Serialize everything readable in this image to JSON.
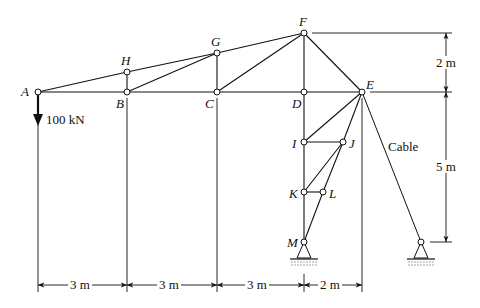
{
  "figure": {
    "type": "truss-with-cable",
    "nodes": [
      {
        "id": "A",
        "x": 38,
        "y": 92
      },
      {
        "id": "H",
        "x": 127,
        "y": 72
      },
      {
        "id": "B",
        "x": 127,
        "y": 92
      },
      {
        "id": "G",
        "x": 217,
        "y": 53
      },
      {
        "id": "C",
        "x": 217,
        "y": 92
      },
      {
        "id": "F",
        "x": 304,
        "y": 33
      },
      {
        "id": "D",
        "x": 304,
        "y": 92
      },
      {
        "id": "E",
        "x": 362,
        "y": 92
      },
      {
        "id": "I",
        "x": 304,
        "y": 142
      },
      {
        "id": "J",
        "x": 343,
        "y": 142
      },
      {
        "id": "K",
        "x": 304,
        "y": 192
      },
      {
        "id": "L",
        "x": 323,
        "y": 192
      },
      {
        "id": "M",
        "x": 304,
        "y": 242
      },
      {
        "id": "S",
        "x": 421,
        "y": 242
      }
    ],
    "members": [
      [
        "A",
        "H"
      ],
      [
        "H",
        "G"
      ],
      [
        "G",
        "F"
      ],
      [
        "A",
        "B"
      ],
      [
        "B",
        "C"
      ],
      [
        "C",
        "D"
      ],
      [
        "D",
        "E"
      ],
      [
        "H",
        "B"
      ],
      [
        "B",
        "G"
      ],
      [
        "G",
        "C"
      ],
      [
        "C",
        "F"
      ],
      [
        "F",
        "D"
      ],
      [
        "F",
        "E"
      ],
      [
        "E",
        "I"
      ],
      [
        "I",
        "J"
      ],
      [
        "J",
        "E"
      ],
      [
        "I",
        "K"
      ],
      [
        "K",
        "J"
      ],
      [
        "J",
        "L"
      ],
      [
        "K",
        "L"
      ],
      [
        "L",
        "M"
      ],
      [
        "K",
        "M"
      ],
      [
        "D",
        "I"
      ]
    ],
    "cable": [
      "E",
      "S"
    ],
    "labels": {
      "A": "A",
      "B": "B",
      "C": "C",
      "D": "D",
      "E": "E",
      "F": "F",
      "G": "G",
      "H": "H",
      "I": "I",
      "J": "J",
      "K": "K",
      "L": "L",
      "M": "M"
    },
    "load": {
      "label": "100 kN",
      "node": "A",
      "direction": "down"
    },
    "cable_label": "Cable",
    "dimensions": {
      "horizontal": [
        "3 m",
        "3 m",
        "3 m",
        "2 m"
      ],
      "vertical_top": "2 m",
      "vertical_bottom": "5 m"
    }
  }
}
